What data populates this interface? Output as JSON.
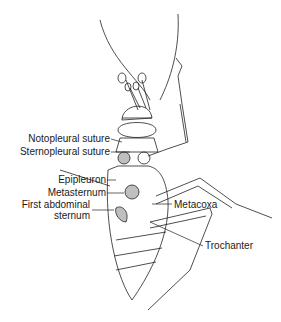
{
  "figure": {
    "colors": {
      "line": "#222222",
      "shade": "#bfbfbf",
      "background": "#ffffff"
    },
    "labels_left": [
      {
        "text": "Notopleural suture"
      },
      {
        "text": "Sternopleural suture"
      },
      {
        "text": "Epipleuron"
      },
      {
        "text": "Metasternum"
      },
      {
        "text": "First abdominal",
        "text2": "sternum"
      }
    ],
    "labels_right": [
      {
        "text": "Metacoxa"
      },
      {
        "text": "Trochanter"
      }
    ]
  }
}
